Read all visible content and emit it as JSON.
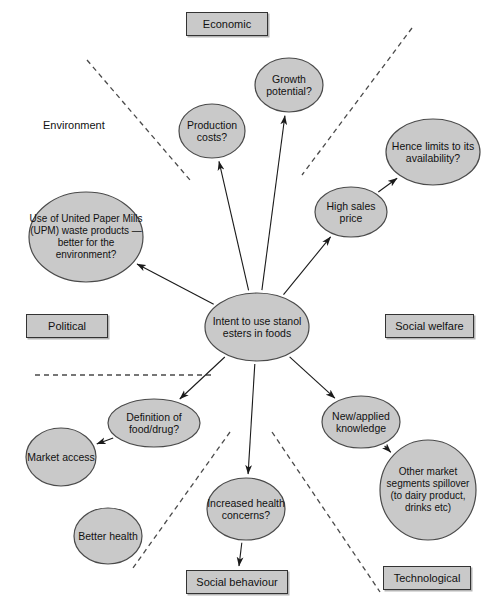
{
  "diagram": {
    "style": {
      "ellipse_fill": "#c9c9c9",
      "ellipse_stroke": "#4a4a4a",
      "box_fill": "#c9c9c9",
      "box_stroke": "#333333",
      "arrow_color": "#1a1a1a",
      "dashed_color": "#4a4a4a",
      "background": "#ffffff"
    },
    "category_tags": [
      {
        "id": "economic",
        "label": "Economic",
        "boxed": true,
        "x": 186,
        "y": 12,
        "w": 82,
        "h": 24
      },
      {
        "id": "environment",
        "label": "Environment",
        "boxed": false,
        "x": 43,
        "y": 119,
        "w": 75,
        "h": 14
      },
      {
        "id": "political",
        "label": "Political",
        "boxed": true,
        "x": 26,
        "y": 314,
        "w": 82,
        "h": 24
      },
      {
        "id": "social-welfare",
        "label": "Social welfare",
        "boxed": true,
        "x": 385,
        "y": 314,
        "w": 89,
        "h": 24
      },
      {
        "id": "social-behaviour",
        "label": "Social behaviour",
        "boxed": true,
        "x": 186,
        "y": 570,
        "w": 102,
        "h": 24
      },
      {
        "id": "technological",
        "label": "Technological",
        "boxed": true,
        "x": 383,
        "y": 566,
        "w": 88,
        "h": 24
      }
    ],
    "nodes": [
      {
        "id": "intent",
        "label": "Intent to use stanol esters in foods",
        "cx": 257,
        "cy": 327,
        "rx": 52,
        "ry": 34,
        "size": "normal"
      },
      {
        "id": "production-costs",
        "label": "Production costs?",
        "cx": 212,
        "cy": 131,
        "rx": 33,
        "ry": 27,
        "size": "normal"
      },
      {
        "id": "growth-potential",
        "label": "Growth potential?",
        "cx": 289,
        "cy": 85,
        "rx": 34,
        "ry": 27,
        "size": "normal"
      },
      {
        "id": "hence-limits",
        "label": "Hence limits to its availability?",
        "cx": 433,
        "cy": 152,
        "rx": 47,
        "ry": 33,
        "size": "normal"
      },
      {
        "id": "high-sales-price",
        "label": "High sales price",
        "cx": 351,
        "cy": 212,
        "rx": 36,
        "ry": 25,
        "size": "normal"
      },
      {
        "id": "upm-waste",
        "label": "Use of United Paper Mills (UPM) waste products — better for the environment?",
        "cx": 86,
        "cy": 237,
        "rx": 57,
        "ry": 45,
        "size": "normal"
      },
      {
        "id": "definition",
        "label": "Definition of food/drug?",
        "cx": 154,
        "cy": 423,
        "rx": 46,
        "ry": 24,
        "size": "normal"
      },
      {
        "id": "market-access",
        "label": "Market access",
        "cx": 61,
        "cy": 457,
        "rx": 35,
        "ry": 29,
        "size": "normal"
      },
      {
        "id": "better-health",
        "label": "Better health",
        "cx": 108,
        "cy": 536,
        "rx": 34,
        "ry": 28,
        "size": "normal"
      },
      {
        "id": "increased-health",
        "label": "Increased health concerns?",
        "cx": 246,
        "cy": 509,
        "rx": 39,
        "ry": 31,
        "size": "normal"
      },
      {
        "id": "new-knowledge",
        "label": "New/applied knowledge",
        "cx": 361,
        "cy": 422,
        "rx": 39,
        "ry": 26,
        "size": "normal"
      },
      {
        "id": "other-segments",
        "label": "Other market segments spillover (to dairy product, drinks etc)",
        "cx": 428,
        "cy": 490,
        "rx": 48,
        "ry": 50,
        "size": "normal"
      }
    ],
    "arrows": [
      {
        "id": "intent-to-production-costs",
        "from": "intent",
        "to": "production-costs"
      },
      {
        "id": "intent-to-growth",
        "from": "intent",
        "to": "growth-potential"
      },
      {
        "id": "intent-to-high-sales",
        "from": "intent",
        "to": "high-sales-price"
      },
      {
        "id": "high-sales-to-hence-limits",
        "from": "high-sales-price",
        "to": "hence-limits"
      },
      {
        "id": "intent-to-upm",
        "from": "intent",
        "to": "upm-waste"
      },
      {
        "id": "intent-to-definition",
        "from": "intent",
        "to": "definition"
      },
      {
        "id": "intent-to-increased-health",
        "from": "intent",
        "to": "increased-health"
      },
      {
        "id": "intent-to-new-knowledge",
        "from": "intent",
        "to": "new-knowledge"
      },
      {
        "id": "definition-to-market",
        "from": "definition",
        "to": "market-access"
      },
      {
        "id": "increased-health-to-social",
        "from": "increased-health",
        "to": "social-behaviour"
      },
      {
        "id": "to-other-segments",
        "from": "new-knowledge",
        "to": "other-segments"
      }
    ],
    "dividers": [
      {
        "id": "divider-upper-left",
        "x1": 87,
        "y1": 60,
        "x2": 190,
        "y2": 180
      },
      {
        "id": "divider-upper-right",
        "x1": 412,
        "y1": 28,
        "x2": 302,
        "y2": 175
      },
      {
        "id": "divider-horizontal",
        "x1": 35,
        "y1": 375,
        "x2": 212,
        "y2": 375
      },
      {
        "id": "divider-lower-left",
        "x1": 230,
        "y1": 432,
        "x2": 133,
        "y2": 568
      },
      {
        "id": "divider-lower-right",
        "x1": 272,
        "y1": 432,
        "x2": 380,
        "y2": 592
      }
    ]
  }
}
